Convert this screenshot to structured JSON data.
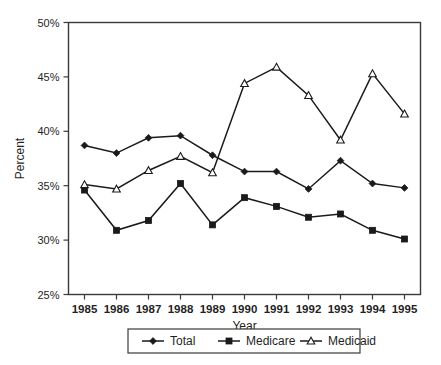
{
  "chart_data": {
    "type": "line",
    "title": "",
    "xlabel": "Year",
    "ylabel": "Percent",
    "categories": [
      "1985",
      "1986",
      "1987",
      "1988",
      "1989",
      "1990",
      "1991",
      "1992",
      "1993",
      "1994",
      "1995"
    ],
    "x": [
      1985,
      1986,
      1987,
      1988,
      1989,
      1990,
      1991,
      1992,
      1993,
      1994,
      1995
    ],
    "ylim": [
      25,
      50
    ],
    "ytick_labels": [
      "25%",
      "30%",
      "35%",
      "40%",
      "45%",
      "50%"
    ],
    "ytick_values": [
      25,
      30,
      35,
      40,
      45,
      50
    ],
    "grid": false,
    "legend_position": "bottom",
    "series": [
      {
        "name": "Total",
        "marker": "filled-diamond",
        "color": "#1a1a1a",
        "values": [
          38.7,
          38.0,
          39.4,
          39.6,
          37.8,
          36.3,
          36.3,
          34.7,
          37.3,
          35.2,
          34.8
        ]
      },
      {
        "name": "Medicare",
        "marker": "filled-square",
        "color": "#1a1a1a",
        "values": [
          34.6,
          30.9,
          31.8,
          35.2,
          31.4,
          33.9,
          33.1,
          32.1,
          32.4,
          30.9,
          30.1
        ]
      },
      {
        "name": "Medicaid",
        "marker": "open-triangle",
        "color": "#1a1a1a",
        "values": [
          35.1,
          34.7,
          36.4,
          37.7,
          36.2,
          44.4,
          45.9,
          43.3,
          39.2,
          45.3,
          41.6
        ]
      }
    ]
  },
  "legend": {
    "items": [
      {
        "label": "Total"
      },
      {
        "label": "Medicare"
      },
      {
        "label": "Medicaid"
      }
    ]
  },
  "axes": {
    "y_title": "Percent",
    "x_title": "Year"
  }
}
